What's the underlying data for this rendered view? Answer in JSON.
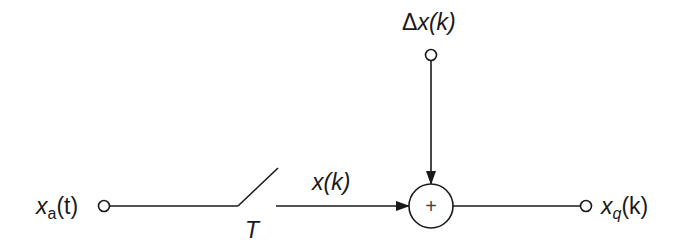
{
  "diagram": {
    "type": "block-diagram",
    "input": {
      "label_main": "x",
      "label_sub": "a",
      "label_arg": "(t)"
    },
    "switch": {
      "label": "T"
    },
    "sampled_signal": {
      "label": "x(k)"
    },
    "noise_input": {
      "label_delta": "Δ",
      "label_rest": "x(k)"
    },
    "summer": {
      "symbol": "+"
    },
    "output": {
      "label_main": "x",
      "label_sub": "q",
      "label_arg": "(k)"
    },
    "colors": {
      "stroke": "#1a1a1a",
      "background": "#ffffff"
    }
  }
}
